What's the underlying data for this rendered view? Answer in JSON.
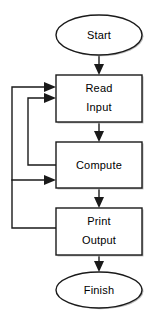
{
  "diagram": {
    "colors": {
      "stroke": "#1a1a1a",
      "fill": "#ffffff",
      "background": "#ffffff",
      "shadow": "#b9b9b9"
    },
    "nodes": [
      {
        "id": "start",
        "label": "Start",
        "shape": "ellipse",
        "lines": [
          "Start"
        ]
      },
      {
        "id": "read",
        "label": "Read Input",
        "shape": "rectangle",
        "lines": [
          "Read",
          "Input"
        ]
      },
      {
        "id": "compute",
        "label": "Compute",
        "shape": "rectangle",
        "lines": [
          "Compute"
        ]
      },
      {
        "id": "print",
        "label": "Print Output",
        "shape": "rectangle",
        "lines": [
          "Print",
          "Output"
        ]
      },
      {
        "id": "finish",
        "label": "Finish",
        "shape": "ellipse",
        "lines": [
          "Finish"
        ]
      }
    ],
    "edges": [
      {
        "id": "start-to-read",
        "from": "start",
        "to": "read",
        "kind": "arrow",
        "direction": "down"
      },
      {
        "id": "read-to-compute",
        "from": "read",
        "to": "compute",
        "kind": "arrow",
        "direction": "down"
      },
      {
        "id": "compute-to-print",
        "from": "compute",
        "to": "print",
        "kind": "arrow",
        "direction": "down"
      },
      {
        "id": "print-to-finish",
        "from": "print",
        "to": "finish",
        "kind": "arrow",
        "direction": "down"
      },
      {
        "id": "compute-back-to-read",
        "from": "compute",
        "to": "read",
        "kind": "feedback",
        "direction": "up-left"
      },
      {
        "id": "print-back-to-read",
        "from": "print",
        "to": "read",
        "kind": "feedback",
        "direction": "up-left"
      },
      {
        "id": "print-back-to-compute",
        "from": "print",
        "to": "compute",
        "kind": "feedback",
        "direction": "up-left"
      }
    ]
  }
}
